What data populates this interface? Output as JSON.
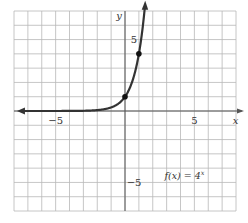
{
  "chart_data": {
    "type": "line",
    "title": "",
    "function_label": "f(x) = 4^x",
    "function_label_parts": {
      "prefix": "f(x) = 4",
      "exponent": "x"
    },
    "xlabel": "x",
    "ylabel": "y",
    "xlim": [
      -8,
      8
    ],
    "ylim": [
      -7,
      7
    ],
    "grid": true,
    "x_ticks_labeled": [
      {
        "value": -5,
        "label": "−5"
      },
      {
        "value": 5,
        "label": "5"
      }
    ],
    "y_ticks_labeled": [
      {
        "value": 5,
        "label": "5"
      },
      {
        "value": -5,
        "label": "−5"
      }
    ],
    "series": [
      {
        "name": "f(x) = 4^x",
        "expression": "4^x",
        "x": [
          -8,
          -6,
          -4,
          -3,
          -2,
          -1,
          -0.5,
          0,
          0.5,
          1,
          1.25,
          1.4
        ],
        "values": [
          2e-05,
          0.0002,
          0.004,
          0.016,
          0.0625,
          0.25,
          0.5,
          1,
          2,
          4,
          5.66,
          6.96
        ]
      }
    ],
    "marked_points": [
      {
        "x": 0,
        "y": 1
      },
      {
        "x": 1,
        "y": 4
      }
    ],
    "colors": {
      "curve": "#333333",
      "grid": "#b8b8b8",
      "axes": "#555555",
      "points": "#111111"
    }
  }
}
